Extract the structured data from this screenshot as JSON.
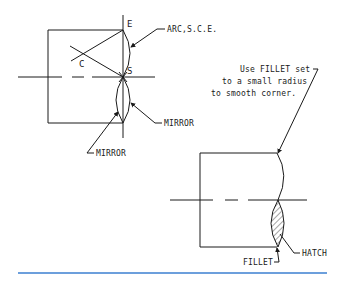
{
  "figure_left": {
    "points": {
      "e": "E",
      "c": "C",
      "s": "S"
    },
    "labels": {
      "arc": "ARC,S.C.E.",
      "mirror_right": "MIRROR",
      "mirror_bottom": "MIRROR"
    }
  },
  "figure_right": {
    "note_lines": [
      "Use FILLET set",
      "to a small radius",
      "to smooth corner."
    ],
    "labels": {
      "hatch": "HATCH",
      "fillet": "FILLET"
    }
  },
  "colors": {
    "line": "#1a1a1a",
    "rule": "#3b7fd1"
  }
}
